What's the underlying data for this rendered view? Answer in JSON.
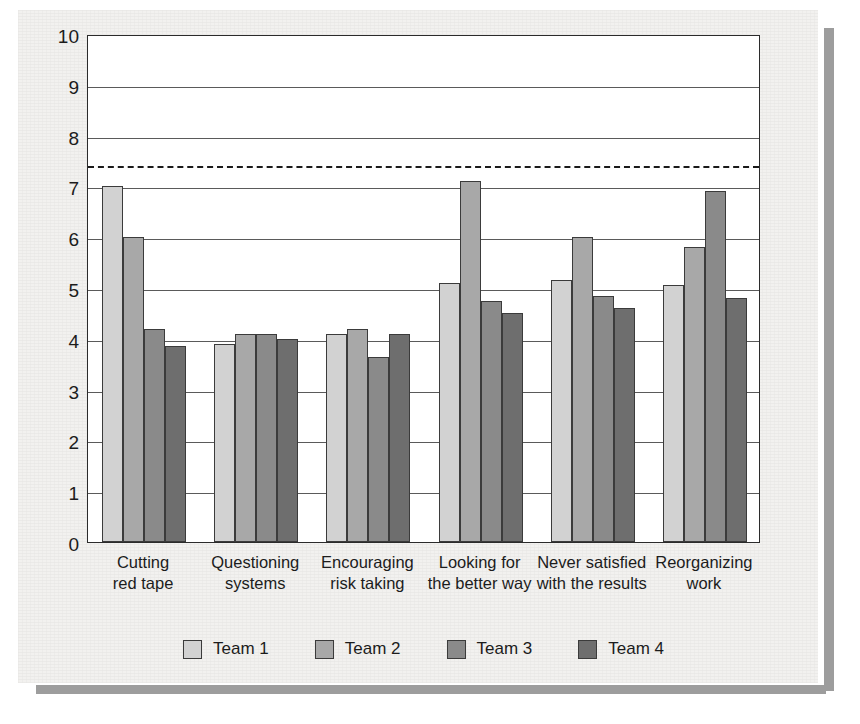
{
  "chart_data": {
    "type": "bar",
    "title": "",
    "subtitle": "",
    "xlabel": "",
    "ylabel": "",
    "ylim": [
      0,
      10
    ],
    "ytick_step": 1,
    "yticks": [
      "10",
      "9",
      "8",
      "7",
      "6",
      "5",
      "4",
      "3",
      "2",
      "1",
      "0"
    ],
    "grid": true,
    "grid_axis": "y",
    "legend_position": "bottom",
    "categories": [
      "Cutting\nred tape",
      "Questioning\nsystems",
      "Encouraging\nrisk taking",
      "Looking for\nthe better way",
      "Never satisfied\nwith the results",
      "Reorganizing\nwork"
    ],
    "category_lines": [
      [
        "Cutting",
        "red tape"
      ],
      [
        "Questioning",
        "systems"
      ],
      [
        "Encouraging",
        "risk taking"
      ],
      [
        "Looking for",
        "the better way"
      ],
      [
        "Never satisfied",
        "with the results"
      ],
      [
        "Reorganizing",
        "work"
      ]
    ],
    "series": [
      {
        "name": "Team 1",
        "color": "#d2d2d2",
        "values": [
          7.0,
          3.9,
          4.1,
          5.1,
          5.15,
          5.05
        ]
      },
      {
        "name": "Team 2",
        "color": "#a8a8a8",
        "values": [
          6.0,
          4.1,
          4.2,
          7.1,
          6.0,
          5.8
        ]
      },
      {
        "name": "Team 3",
        "color": "#8a8a8a",
        "values": [
          4.2,
          4.1,
          3.65,
          4.75,
          4.85,
          6.9
        ]
      },
      {
        "name": "Team 4",
        "color": "#6e6e6e",
        "values": [
          3.85,
          4.0,
          4.1,
          4.5,
          4.6,
          4.8
        ]
      }
    ],
    "annotations": [
      {
        "type": "threshold-line",
        "style": "dashed",
        "value": 7.45,
        "color": "#1a1a1a"
      }
    ]
  },
  "legend": {
    "items": [
      {
        "label": "Team 1",
        "color": "#d2d2d2"
      },
      {
        "label": "Team 2",
        "color": "#a8a8a8"
      },
      {
        "label": "Team 3",
        "color": "#8a8a8a"
      },
      {
        "label": "Team 4",
        "color": "#6e6e6e"
      }
    ]
  },
  "colors": {
    "panel_background": "#f2f1ef",
    "plot_background": "#ffffff",
    "axis": "#2b2b2b",
    "gridline": "#5a5a5a",
    "text": "#1c1c1c",
    "shadow": "#9d9d9d"
  }
}
